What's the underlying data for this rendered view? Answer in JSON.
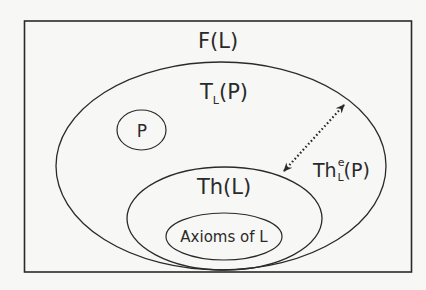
{
  "diagram": {
    "outer_box": {
      "label": "F(L)"
    },
    "sets": [
      {
        "id": "tlp",
        "label_main": "T",
        "label_sub": "L",
        "label_tail": "(P)"
      },
      {
        "id": "p",
        "label": "P"
      },
      {
        "id": "thl",
        "label": "Th(L)"
      },
      {
        "id": "axioms",
        "label": "Axioms of L"
      }
    ],
    "arrow": {
      "style": "dotted double-headed",
      "label_main": "Th",
      "label_sup": "e",
      "label_sub": "L",
      "label_tail": "(P)"
    },
    "colors": {
      "stroke": "#2a2a2a",
      "background": "#f7f7f5"
    }
  }
}
